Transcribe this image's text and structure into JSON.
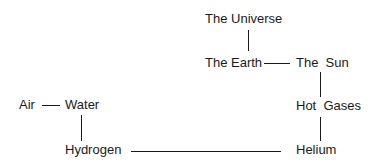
{
  "diagram": {
    "type": "concept-chain",
    "nodes": {
      "universe": "The Universe",
      "earth": "The Earth",
      "sun": "The  Sun",
      "hot_gases": "Hot  Gases",
      "helium": "Helium",
      "hydrogen": "Hydrogen",
      "water": "Water",
      "air": "Air"
    },
    "edges": [
      [
        "The Universe",
        "The Earth"
      ],
      [
        "The Earth",
        "The Sun"
      ],
      [
        "The Sun",
        "Hot Gases"
      ],
      [
        "Hot Gases",
        "Helium"
      ],
      [
        "Helium",
        "Hydrogen"
      ],
      [
        "Hydrogen",
        "Water"
      ],
      [
        "Water",
        "Air"
      ]
    ],
    "line_color": "#1a1a1a"
  }
}
